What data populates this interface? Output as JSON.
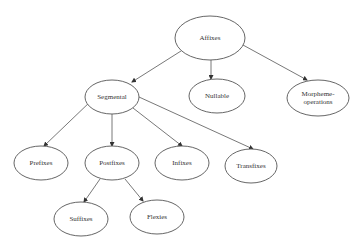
{
  "diagram": {
    "type": "tree",
    "nodes": [
      {
        "id": "affixes",
        "label": "Affixes",
        "cx": 210,
        "cy": 38,
        "rx": 35,
        "ry": 22
      },
      {
        "id": "segmental",
        "label": "Segmental",
        "cx": 112,
        "cy": 97,
        "rx": 27,
        "ry": 17
      },
      {
        "id": "nullable",
        "label": "Nullable",
        "cx": 217,
        "cy": 96,
        "rx": 28,
        "ry": 17
      },
      {
        "id": "morpheme-operations",
        "label": "Morpheme-",
        "label2": "operations",
        "cx": 318,
        "cy": 98,
        "rx": 31,
        "ry": 18
      },
      {
        "id": "prefixes",
        "label": "Prefixes",
        "cx": 41,
        "cy": 163,
        "rx": 27,
        "ry": 17
      },
      {
        "id": "postfixes",
        "label": "Postfixes",
        "cx": 112,
        "cy": 163,
        "rx": 27,
        "ry": 17
      },
      {
        "id": "infixes",
        "label": "Infixes",
        "cx": 182,
        "cy": 163,
        "rx": 27,
        "ry": 17
      },
      {
        "id": "transfixes",
        "label": "Transfixes",
        "cx": 251,
        "cy": 166,
        "rx": 26,
        "ry": 17
      },
      {
        "id": "suffixes",
        "label": "Suffixes",
        "cx": 81,
        "cy": 219,
        "rx": 27,
        "ry": 17
      },
      {
        "id": "flexies",
        "label": "Flexies",
        "cx": 157,
        "cy": 217,
        "rx": 27,
        "ry": 17
      }
    ],
    "edges": [
      {
        "from": "affixes",
        "to": "segmental"
      },
      {
        "from": "affixes",
        "to": "nullable"
      },
      {
        "from": "affixes",
        "to": "morpheme-operations"
      },
      {
        "from": "segmental",
        "to": "prefixes"
      },
      {
        "from": "segmental",
        "to": "postfixes"
      },
      {
        "from": "segmental",
        "to": "infixes"
      },
      {
        "from": "segmental",
        "to": "transfixes"
      },
      {
        "from": "postfixes",
        "to": "suffixes"
      },
      {
        "from": "postfixes",
        "to": "flexies"
      }
    ]
  }
}
